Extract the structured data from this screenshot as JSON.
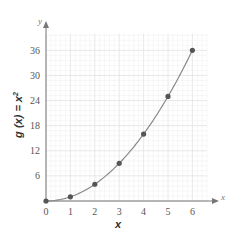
{
  "chart_data": {
    "type": "line",
    "title": "",
    "xlabel": "x",
    "ylabel": "g(x) = x²",
    "ylabel_parts": {
      "main": "g (x) = x",
      "sup": "2"
    },
    "x_axis_letter": "x",
    "y_axis_letter": "y",
    "xlim": [
      0,
      6.6
    ],
    "ylim": [
      0,
      40
    ],
    "x_ticks": [
      0,
      1,
      2,
      3,
      4,
      5,
      6
    ],
    "x_tick_labels": [
      "0",
      "1",
      "2",
      "3",
      "4",
      "5",
      "6"
    ],
    "y_ticks": [
      6,
      12,
      18,
      24,
      30,
      36
    ],
    "y_tick_labels": [
      "6",
      "12",
      "18",
      "24",
      "30",
      "36"
    ],
    "grid": true,
    "minor_grid_step": {
      "x": 0.2,
      "y": 1.2
    },
    "series": [
      {
        "name": "g(x) = x^2",
        "function": "x^2",
        "x": [
          0,
          1,
          2,
          3,
          4,
          5,
          6
        ],
        "y": [
          0,
          1,
          4,
          9,
          16,
          25,
          36
        ],
        "curve_color": "#8a8a8a",
        "marker_color": "#555555"
      }
    ],
    "colors": {
      "axis": "#777777",
      "grid_minor": "#eeeeee",
      "grid_major": "#e2e2e2"
    }
  }
}
